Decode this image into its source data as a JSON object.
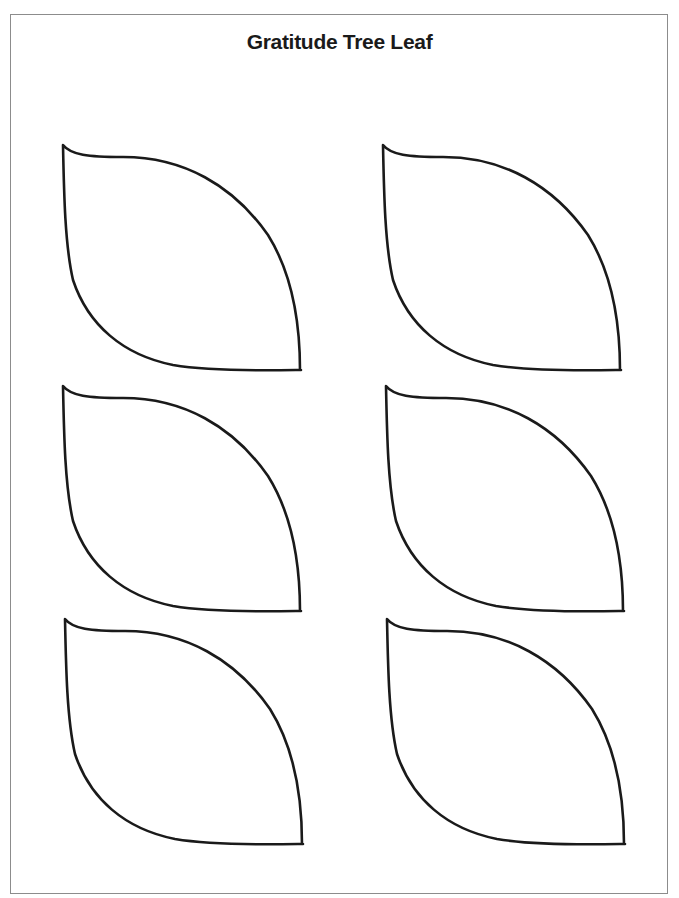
{
  "document": {
    "title": "Gratitude Tree Leaf",
    "leaf_count": 6,
    "layout": "3 rows x 2 columns",
    "leaves": [
      {
        "label": "leaf-1"
      },
      {
        "label": "leaf-2"
      },
      {
        "label": "leaf-3"
      },
      {
        "label": "leaf-4"
      },
      {
        "label": "leaf-5"
      },
      {
        "label": "leaf-6"
      }
    ]
  }
}
